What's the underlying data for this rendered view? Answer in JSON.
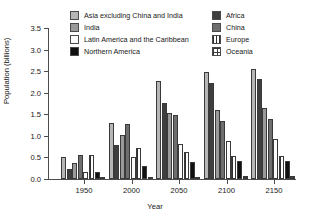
{
  "chart_data": {
    "type": "bar",
    "title": "",
    "xlabel": "Year",
    "ylabel": "Population (billions)",
    "categories": [
      "1950",
      "2000",
      "2050",
      "2100",
      "2150"
    ],
    "ylim": [
      0.0,
      3.5
    ],
    "yticks": [
      "0.0",
      "0.5",
      "1.0",
      "1.5",
      "2.0",
      "2.5",
      "3.0",
      "3.5"
    ],
    "ytick_values": [
      0.0,
      0.5,
      1.0,
      1.5,
      2.0,
      2.5,
      3.0,
      3.5
    ],
    "grid": false,
    "legend_position": "top",
    "series": [
      {
        "name": "Asia excluding China and India",
        "key": "asia",
        "values": [
          0.5,
          1.3,
          2.27,
          2.49,
          2.55
        ]
      },
      {
        "name": "Africa",
        "key": "africa",
        "values": [
          0.23,
          0.8,
          1.77,
          2.22,
          2.31
        ]
      },
      {
        "name": "India",
        "key": "india",
        "values": [
          0.37,
          1.01,
          1.54,
          1.59,
          1.65
        ]
      },
      {
        "name": "China",
        "key": "china",
        "values": [
          0.55,
          1.27,
          1.48,
          1.34,
          1.38
        ]
      },
      {
        "name": "Latin America and the Caribbean",
        "key": "latin",
        "values": [
          0.17,
          0.52,
          0.81,
          0.88,
          0.92
        ]
      },
      {
        "name": "Europe",
        "key": "europe",
        "values": [
          0.55,
          0.72,
          0.63,
          0.53,
          0.54
        ]
      },
      {
        "name": "Northern America",
        "key": "northern",
        "values": [
          0.17,
          0.31,
          0.4,
          0.41,
          0.41
        ]
      },
      {
        "name": "Oceania",
        "key": "oceania",
        "values": [
          0.01,
          0.03,
          0.05,
          0.06,
          0.07
        ]
      }
    ]
  },
  "legend": {
    "columns": [
      {
        "items": [
          {
            "label": "Asia excluding China and India",
            "swatch": "asia"
          },
          {
            "label": "India",
            "swatch": "india"
          },
          {
            "label": "Latin America and the Caribbean",
            "swatch": "latin"
          },
          {
            "label": "Northern America",
            "swatch": "northern"
          }
        ]
      },
      {
        "items": [
          {
            "label": "Africa",
            "swatch": "africa"
          },
          {
            "label": "China",
            "swatch": "china"
          },
          {
            "label": "Europe",
            "swatch": "europe"
          },
          {
            "label": "Oceania",
            "swatch": "oceania"
          }
        ]
      }
    ]
  },
  "colors": {
    "asia": "#b6b6b6",
    "africa": "#3f3f3f",
    "india": "#9a9a9a",
    "china": "#6e6e6e",
    "latin": "#fbfbfb",
    "europe": "#2e2e2e",
    "northern": "#101010",
    "oceania": "#3a3a3a",
    "axis": "#4c4c4c",
    "text": "#181818",
    "background": "#ffffff"
  }
}
